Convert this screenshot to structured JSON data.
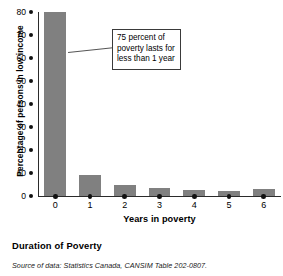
{
  "chart_data": {
    "type": "bar",
    "title": "Duration of Poverty",
    "xlabel": "Years in poverty",
    "ylabel": "Percentage of persons in low income",
    "categories": [
      "0",
      "1",
      "2",
      "3",
      "4",
      "5",
      "6"
    ],
    "values": [
      80,
      9,
      5,
      3.5,
      2.5,
      2,
      3
    ],
    "ylim": [
      0,
      80
    ],
    "yticks": [
      "80",
      "70",
      "60",
      "50",
      "40",
      "30",
      "20",
      "10",
      "0"
    ],
    "ytick_values": [
      80,
      70,
      60,
      50,
      40,
      30,
      20,
      10,
      0
    ],
    "grid": false,
    "legend": "none",
    "bar_color": "#808080",
    "annotations": [
      {
        "lines": [
          "75 percent of",
          "poverty lasts for",
          "less than 1 year"
        ],
        "points_at_category": "0"
      }
    ]
  },
  "caption": "Duration of Poverty",
  "source": "Source of data: Statistics Canada, CANSIM Table 202-0807."
}
